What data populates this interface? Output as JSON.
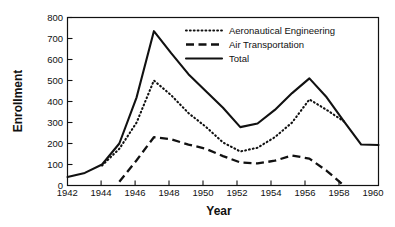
{
  "chart_data": {
    "type": "line",
    "title": "",
    "xlabel": "Year",
    "ylabel": "Enrollment",
    "xlim": [
      1942,
      1960
    ],
    "ylim": [
      0,
      800
    ],
    "xticks": [
      1942,
      1944,
      1946,
      1948,
      1950,
      1952,
      1954,
      1956,
      1958,
      1960
    ],
    "yticks": [
      0,
      100,
      200,
      300,
      400,
      500,
      600,
      700,
      800
    ],
    "grid": false,
    "legend_position": "top-right",
    "series": [
      {
        "name": "Aeronautical Engineering",
        "style": "dotted",
        "x": [
          1944,
          1945,
          1946,
          1947,
          1948,
          1949,
          1950,
          1951,
          1952,
          1953,
          1954,
          1955,
          1956,
          1957,
          1958
        ],
        "values": [
          95,
          175,
          300,
          500,
          430,
          345,
          280,
          205,
          162,
          180,
          230,
          300,
          410,
          360,
          305
        ]
      },
      {
        "name": "Air Transportation",
        "style": "dashed",
        "x": [
          1945,
          1946,
          1947,
          1948,
          1949,
          1950,
          1951,
          1952,
          1953,
          1954,
          1955,
          1956,
          1957,
          1958
        ],
        "values": [
          18,
          120,
          230,
          220,
          195,
          175,
          140,
          110,
          105,
          118,
          143,
          128,
          70,
          0
        ]
      },
      {
        "name": "Total",
        "style": "solid",
        "x": [
          1942,
          1943,
          1944,
          1945,
          1946,
          1947,
          1948,
          1949,
          1950,
          1951,
          1952,
          1953,
          1954,
          1955,
          1956,
          1957,
          1958,
          1959,
          1960
        ],
        "values": [
          40,
          60,
          100,
          200,
          420,
          735,
          630,
          530,
          450,
          370,
          278,
          295,
          360,
          440,
          510,
          420,
          305,
          195,
          193
        ]
      }
    ]
  },
  "legend": {
    "entries": [
      {
        "label": "Aeronautical Engineering",
        "style": "dotted"
      },
      {
        "label": "Air Transportation",
        "style": "dashed"
      },
      {
        "label": "Total",
        "style": "solid"
      }
    ]
  },
  "axes": {
    "y_title": "Enrollment",
    "x_title": "Year",
    "y_tick_labels": [
      "800",
      "700",
      "600",
      "500",
      "400",
      "300",
      "200",
      "100",
      "0"
    ],
    "x_tick_labels": [
      "1942",
      "1944",
      "1946",
      "1948",
      "1950",
      "1952",
      "1954",
      "1956",
      "1958",
      "1960"
    ]
  },
  "colors": {
    "ink": "#111111",
    "background": "#ffffff"
  }
}
